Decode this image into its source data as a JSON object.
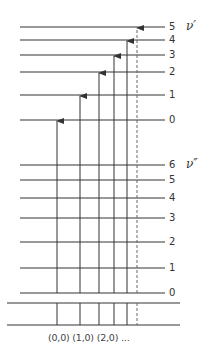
{
  "diagram": {
    "type": "vibrational-energy-level-diagram",
    "upper_state": {
      "symbol": "ν′",
      "levels": [
        {
          "label": "0",
          "y": 120
        },
        {
          "label": "1",
          "y": 95
        },
        {
          "label": "2",
          "y": 72
        },
        {
          "label": "3",
          "y": 55
        },
        {
          "label": "4",
          "y": 40
        },
        {
          "label": "5",
          "y": 27
        }
      ]
    },
    "lower_state": {
      "symbol": "ν″",
      "levels": [
        {
          "label": "0",
          "y": 293
        },
        {
          "label": "1",
          "y": 268
        },
        {
          "label": "2",
          "y": 242
        },
        {
          "label": "3",
          "y": 218
        },
        {
          "label": "4",
          "y": 198
        },
        {
          "label": "5",
          "y": 180
        },
        {
          "label": "6",
          "y": 165
        }
      ]
    },
    "transitions": [
      {
        "from": "0",
        "to": "0",
        "x": 57,
        "dashed": false
      },
      {
        "from": "0",
        "to": "1",
        "x": 80,
        "dashed": false
      },
      {
        "from": "0",
        "to": "2",
        "x": 99,
        "dashed": false
      },
      {
        "from": "0",
        "to": "3",
        "x": 114,
        "dashed": false
      },
      {
        "from": "0",
        "to": "4",
        "x": 127,
        "dashed": false
      },
      {
        "from": "0",
        "to": "5",
        "x": 137,
        "dashed": true
      }
    ],
    "spectrum_axis_lines_y": [
      303,
      325
    ],
    "transition_label": "(0,0) (1,0) (2,0) ..."
  }
}
